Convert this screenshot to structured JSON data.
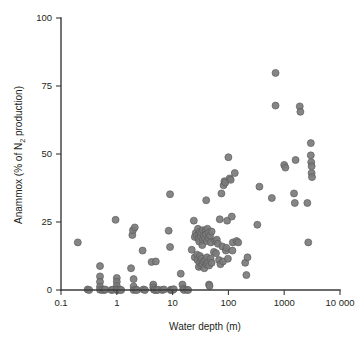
{
  "chart_data": {
    "type": "scatter",
    "title": "",
    "xlabel": "Water depth (m)",
    "ylabel_parts": {
      "lead": "Anammox (% of N",
      "subscript": "2",
      "tail": " production)"
    },
    "ylabel": "Anammox (% of N2 production)",
    "xscale": "log",
    "yscale": "linear",
    "xlim": [
      0.1,
      10000
    ],
    "ylim": [
      0,
      100
    ],
    "grid": false,
    "legend": null,
    "xticks": [
      0.1,
      1,
      10,
      100,
      1000,
      10000
    ],
    "xtick_labels": [
      "0.1",
      "1",
      "10",
      "100",
      "1000",
      "10 000"
    ],
    "yticks": [
      0,
      25,
      50,
      75,
      100
    ],
    "ytick_labels": [
      "0",
      "25",
      "50",
      "75",
      "100"
    ],
    "marker": {
      "shape": "circle",
      "fill_color": "#7b7b7b",
      "edge_color": "#5d5d5d",
      "diameter_px": 7
    },
    "axis_color": "#3a3a3a",
    "background_color": "#ffffff",
    "n_points": 160,
    "points": [
      [
        0.2,
        17.5
      ],
      [
        0.3,
        0.2
      ],
      [
        0.32,
        0.0
      ],
      [
        0.5,
        8.8
      ],
      [
        0.5,
        5.0
      ],
      [
        0.5,
        3.0
      ],
      [
        0.5,
        1.2
      ],
      [
        0.5,
        0.1
      ],
      [
        0.55,
        0.0
      ],
      [
        0.6,
        0.0
      ],
      [
        0.62,
        0.2
      ],
      [
        0.8,
        0.0
      ],
      [
        0.85,
        0.1
      ],
      [
        0.95,
        25.8
      ],
      [
        1.0,
        4.4
      ],
      [
        1.0,
        3.0
      ],
      [
        1.0,
        1.5
      ],
      [
        1.0,
        0.3
      ],
      [
        1.0,
        0.0
      ],
      [
        1.05,
        0.0
      ],
      [
        1.15,
        0.1
      ],
      [
        1.2,
        0.0
      ],
      [
        1.8,
        8.0
      ],
      [
        1.9,
        20.2
      ],
      [
        1.95,
        22.0
      ],
      [
        2.0,
        4.0
      ],
      [
        2.0,
        1.3
      ],
      [
        2.0,
        0.0
      ],
      [
        2.1,
        23.0
      ],
      [
        2.2,
        0.1
      ],
      [
        2.3,
        0.0
      ],
      [
        2.9,
        14.5
      ],
      [
        3.0,
        0.2
      ],
      [
        3.2,
        0.0
      ],
      [
        4.2,
        10.3
      ],
      [
        4.5,
        2.0
      ],
      [
        4.5,
        1.0
      ],
      [
        4.6,
        0.2
      ],
      [
        4.8,
        0.0
      ],
      [
        5.0,
        10.5
      ],
      [
        5.2,
        0.0
      ],
      [
        5.5,
        0.1
      ],
      [
        6.5,
        0.0
      ],
      [
        7.0,
        0.2
      ],
      [
        8.5,
        21.8
      ],
      [
        9.0,
        35.2
      ],
      [
        9.0,
        15.8
      ],
      [
        9.2,
        0.0
      ],
      [
        9.5,
        0.1
      ],
      [
        10.0,
        0.0
      ],
      [
        10.5,
        0.3
      ],
      [
        14.0,
        6.0
      ],
      [
        15.0,
        2.0
      ],
      [
        15.5,
        0.5
      ],
      [
        16.0,
        0.0
      ],
      [
        18.0,
        0.1
      ],
      [
        19.0,
        0.0
      ],
      [
        22.0,
        14.8
      ],
      [
        24.0,
        25.5
      ],
      [
        25.0,
        19.5
      ],
      [
        25.0,
        12.0
      ],
      [
        26.0,
        21.0
      ],
      [
        27.0,
        20.0
      ],
      [
        27.5,
        13.0
      ],
      [
        28.0,
        11.0
      ],
      [
        28.5,
        22.5
      ],
      [
        29.0,
        19.0
      ],
      [
        29.5,
        8.5
      ],
      [
        30.0,
        20.5
      ],
      [
        30.0,
        17.8
      ],
      [
        30.5,
        10.0
      ],
      [
        31.0,
        21.5
      ],
      [
        31.0,
        12.5
      ],
      [
        32.0,
        19.8
      ],
      [
        32.5,
        9.0
      ],
      [
        33.0,
        21.0
      ],
      [
        33.5,
        11.5
      ],
      [
        34.0,
        16.5
      ],
      [
        34.5,
        9.5
      ],
      [
        35.0,
        22.0
      ],
      [
        35.0,
        18.5
      ],
      [
        36.0,
        10.5
      ],
      [
        36.5,
        20.0
      ],
      [
        37.0,
        8.0
      ],
      [
        38.0,
        19.0
      ],
      [
        38.5,
        11.0
      ],
      [
        39.0,
        21.8
      ],
      [
        40.0,
        33.0
      ],
      [
        40.0,
        20.5
      ],
      [
        40.5,
        9.5
      ],
      [
        41.0,
        18.0
      ],
      [
        41.5,
        12.0
      ],
      [
        42.0,
        22.5
      ],
      [
        43.0,
        10.0
      ],
      [
        44.0,
        21.0
      ],
      [
        44.5,
        19.0
      ],
      [
        45.0,
        9.0
      ],
      [
        45.0,
        2.0
      ],
      [
        46.0,
        1.5
      ],
      [
        47.0,
        20.0
      ],
      [
        48.0,
        11.5
      ],
      [
        48.5,
        17.5
      ],
      [
        50.0,
        21.5
      ],
      [
        50.0,
        10.0
      ],
      [
        55.0,
        14.0
      ],
      [
        58.0,
        18.0
      ],
      [
        60.0,
        13.5
      ],
      [
        62.0,
        18.5
      ],
      [
        65.0,
        17.0
      ],
      [
        68.0,
        11.0
      ],
      [
        70.0,
        26.0
      ],
      [
        72.0,
        9.5
      ],
      [
        75.0,
        35.5
      ],
      [
        78.0,
        16.0
      ],
      [
        80.0,
        10.5
      ],
      [
        82.0,
        38.5
      ],
      [
        85.0,
        40.0
      ],
      [
        88.0,
        39.5
      ],
      [
        90.0,
        14.5
      ],
      [
        92.0,
        15.5
      ],
      [
        95.0,
        25.5
      ],
      [
        98.0,
        11.5
      ],
      [
        100.0,
        48.8
      ],
      [
        105.0,
        41.0
      ],
      [
        110.0,
        40.5
      ],
      [
        115.0,
        27.0
      ],
      [
        118.0,
        14.5
      ],
      [
        120.0,
        17.5
      ],
      [
        130.0,
        43.0
      ],
      [
        140.0,
        18.0
      ],
      [
        150.0,
        17.5
      ],
      [
        200.0,
        10.0
      ],
      [
        210.0,
        5.5
      ],
      [
        220.0,
        12.0
      ],
      [
        330.0,
        24.0
      ],
      [
        360.0,
        38.0
      ],
      [
        600.0,
        33.8
      ],
      [
        700.0,
        79.8
      ],
      [
        700.0,
        67.8
      ],
      [
        1000.0,
        46.0
      ],
      [
        1050.0,
        45.0
      ],
      [
        1500.0,
        35.5
      ],
      [
        1550.0,
        32.0
      ],
      [
        1600.0,
        47.8
      ],
      [
        1900.0,
        67.5
      ],
      [
        1950.0,
        65.5
      ],
      [
        2600.0,
        32.0
      ],
      [
        2700.0,
        17.5
      ],
      [
        3000.0,
        54.0
      ],
      [
        3000.0,
        49.5
      ],
      [
        3050.0,
        47.0
      ],
      [
        3100.0,
        45.5
      ],
      [
        3100.0,
        43.0
      ],
      [
        3150.0,
        41.5
      ]
    ]
  }
}
